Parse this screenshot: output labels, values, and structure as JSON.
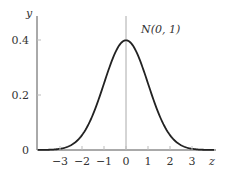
{
  "chart_data": {
    "type": "line",
    "title": "",
    "annotation": "N(0, 1)",
    "xlabel": "z",
    "ylabel": "y",
    "xlim": [
      -4,
      4
    ],
    "ylim": [
      0,
      0.45
    ],
    "x_ticks": [
      -3,
      -2,
      -1,
      0,
      1,
      2,
      3
    ],
    "x_tick_labels": [
      "−3",
      "−2",
      "−1",
      "0",
      "1",
      "2",
      "3"
    ],
    "y_ticks": [
      0,
      0.2,
      0.4
    ],
    "y_tick_labels": [
      "0",
      "0.2",
      "0.4"
    ],
    "grid": false,
    "legend": null,
    "series": [
      {
        "name": "N(0, 1)",
        "color": "#222222",
        "x": [
          -4,
          -3.5,
          -3,
          -2.5,
          -2,
          -1.5,
          -1,
          -0.5,
          0,
          0.5,
          1,
          1.5,
          2,
          2.5,
          3,
          3.5,
          4
        ],
        "values": [
          0.0001,
          0.0009,
          0.0044,
          0.0175,
          0.054,
          0.1295,
          0.242,
          0.3521,
          0.3989,
          0.3521,
          0.242,
          0.1295,
          0.054,
          0.0175,
          0.0044,
          0.0009,
          0.0001
        ]
      }
    ],
    "vertical_line_at_x": 0
  },
  "colors": {
    "axis": "#555555",
    "curve": "#222222",
    "center_line": "#aaaaaa"
  }
}
